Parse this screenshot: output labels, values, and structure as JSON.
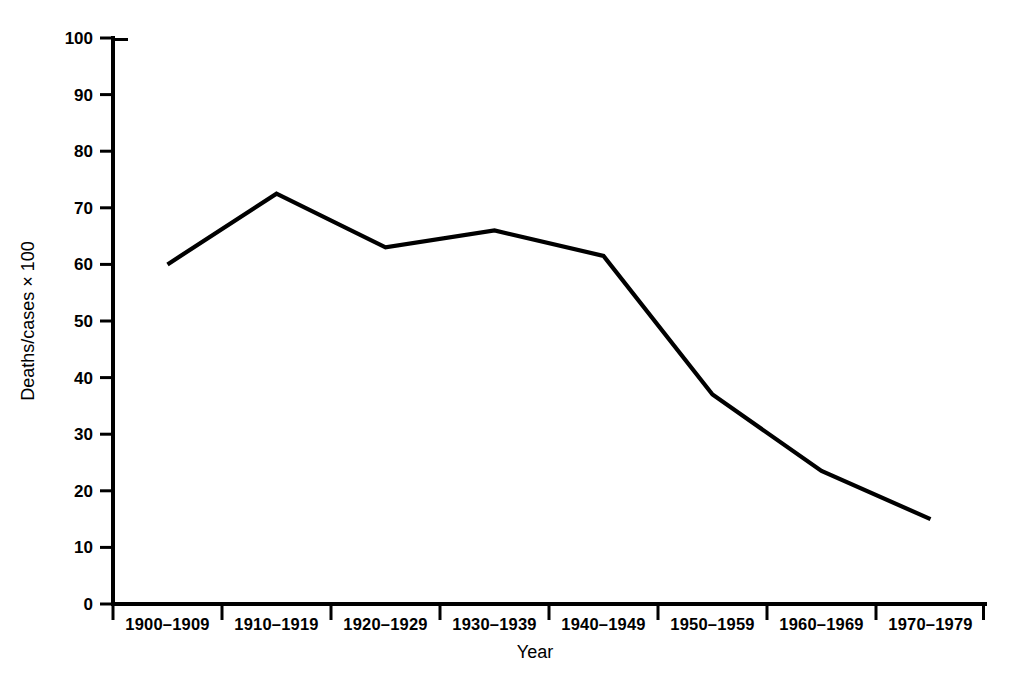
{
  "chart_data": {
    "type": "line",
    "title": "",
    "xlabel": "Year",
    "ylabel": "Deaths/cases × 100",
    "categories": [
      "1900–1909",
      "1910–1919",
      "1920–1929",
      "1930–1939",
      "1940–1949",
      "1950–1959",
      "1960–1969",
      "1970–1979"
    ],
    "values": [
      60,
      72.5,
      63,
      66,
      61.5,
      37,
      23.5,
      15
    ],
    "series": [
      {
        "name": "Deaths/cases × 100",
        "values": [
          60,
          72.5,
          63,
          66,
          61.5,
          37,
          23.5,
          15
        ]
      }
    ],
    "ylim": [
      0,
      100
    ],
    "ytick_labels": [
      "0",
      "10",
      "20",
      "30",
      "40",
      "50",
      "60",
      "70",
      "80",
      "90",
      "100"
    ],
    "ytick_values": [
      0,
      10,
      20,
      30,
      40,
      50,
      60,
      70,
      80,
      90,
      100
    ],
    "grid": false,
    "legend": "none",
    "line_color": "#000000",
    "background_color": "#ffffff",
    "markers": false
  }
}
